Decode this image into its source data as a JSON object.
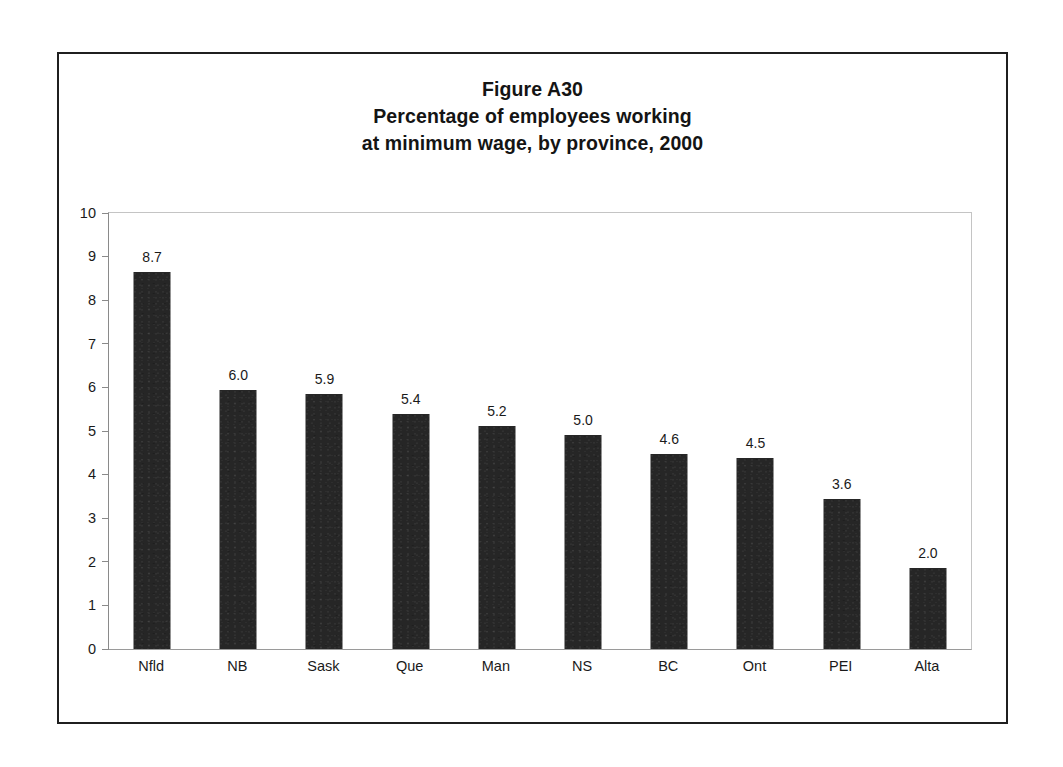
{
  "figure": {
    "title_lines": [
      "Figure A30",
      "Percentage of employees working",
      "at minimum wage, by province, 2000"
    ],
    "border_color": "#1f1f1f"
  },
  "chart_data": {
    "type": "bar",
    "title": "Figure A30 Percentage of employees working at minimum wage, by province, 2000",
    "xlabel": "",
    "ylabel": "",
    "ylim": [
      0,
      10
    ],
    "y_ticks": [
      "0",
      "1",
      "2",
      "3",
      "4",
      "5",
      "6",
      "7",
      "8",
      "9",
      "10"
    ],
    "grid": false,
    "legend": false,
    "bar_color": "#262626",
    "value_label_format": "one-decimal",
    "categories": [
      "Nfld",
      "NB",
      "Sask",
      "Que",
      "Man",
      "NS",
      "BC",
      "Ont",
      "PEI",
      "Alta"
    ],
    "values": [
      8.7,
      6.0,
      5.9,
      5.4,
      5.2,
      5.0,
      4.6,
      4.5,
      3.6,
      2.0
    ],
    "value_labels": [
      "8.7",
      "6.0",
      "5.9",
      "5.4",
      "5.2",
      "5.0",
      "4.6",
      "4.5",
      "3.6",
      "2.0"
    ],
    "bar_heights_drawn": [
      8.65,
      5.95,
      5.86,
      5.38,
      5.12,
      4.9,
      4.48,
      4.38,
      3.44,
      1.86
    ]
  }
}
